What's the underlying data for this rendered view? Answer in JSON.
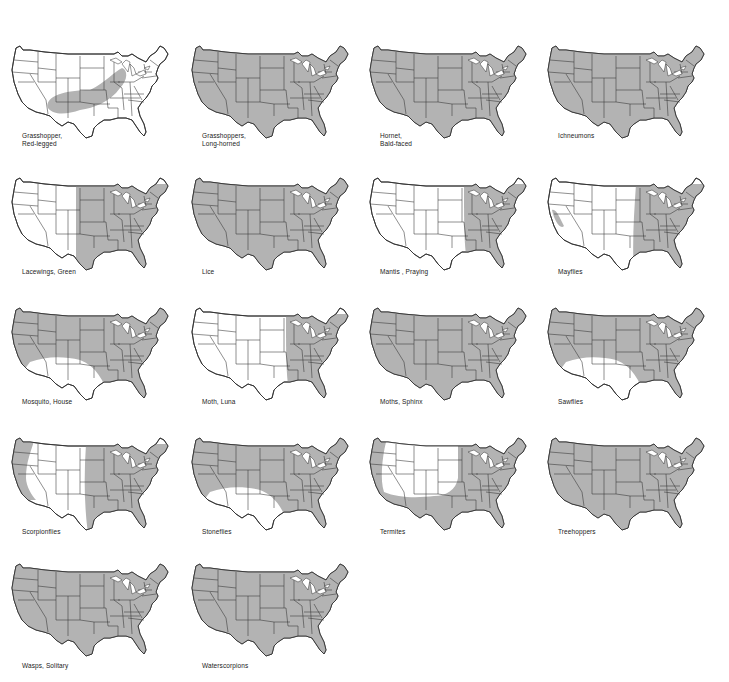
{
  "figure": {
    "colors": {
      "shaded": "#b3b3b3",
      "unshaded": "#ffffff",
      "borders": "#333333"
    },
    "panels": [
      {
        "label_line1": "Grasshopper,",
        "label_line2": "Red-legged",
        "range": "band",
        "row": 0,
        "col": 0
      },
      {
        "label_line1": "Grasshoppers,",
        "label_line2": "Long-horned",
        "range": "all",
        "row": 0,
        "col": 1
      },
      {
        "label_line1": "Hornet,",
        "label_line2": "Bald-faced",
        "range": "all",
        "row": 0,
        "col": 2
      },
      {
        "label_line1": "Ichneumons",
        "label_line2": "",
        "range": "all",
        "row": 0,
        "col": 3
      },
      {
        "label_line1": "Lacewings, Green",
        "label_line2": "",
        "range": "east-of-rockies",
        "row": 1,
        "col": 0
      },
      {
        "label_line1": "Lice",
        "label_line2": "",
        "range": "all",
        "row": 1,
        "col": 1
      },
      {
        "label_line1": "Mantis , Praying",
        "label_line2": "",
        "range": "east-of-plains",
        "row": 1,
        "col": 2
      },
      {
        "label_line1": "Mayflies",
        "label_line2": "",
        "range": "east-plus-ca",
        "row": 1,
        "col": 3
      },
      {
        "label_line1": "Mosquito, House",
        "label_line2": "",
        "range": "not-southwest",
        "row": 2,
        "col": 0
      },
      {
        "label_line1": "Moth, Luna",
        "label_line2": "",
        "range": "east-of-plains",
        "row": 2,
        "col": 1
      },
      {
        "label_line1": "Moths, Sphinx",
        "label_line2": "",
        "range": "all",
        "row": 2,
        "col": 2
      },
      {
        "label_line1": "Sawflies",
        "label_line2": "",
        "range": "not-southwest",
        "row": 2,
        "col": 3
      },
      {
        "label_line1": "Scorpionflies",
        "label_line2": "",
        "range": "east-plus-coast",
        "row": 3,
        "col": 0
      },
      {
        "label_line1": "Stoneflies",
        "label_line2": "",
        "range": "not-southwest",
        "row": 3,
        "col": 1
      },
      {
        "label_line1": "Termites",
        "label_line2": "",
        "range": "not-interior-west",
        "row": 3,
        "col": 2
      },
      {
        "label_line1": "Treehoppers",
        "label_line2": "",
        "range": "all",
        "row": 3,
        "col": 3
      },
      {
        "label_line1": "Wasps, Solitary",
        "label_line2": "",
        "range": "all",
        "row": 4,
        "col": 0
      },
      {
        "label_line1": "Waterscorpions",
        "label_line2": "",
        "range": "all",
        "row": 4,
        "col": 1
      }
    ]
  }
}
